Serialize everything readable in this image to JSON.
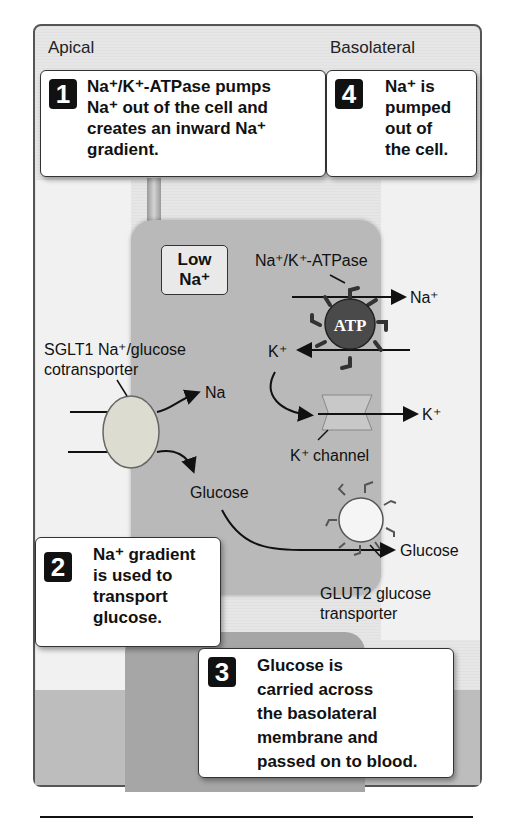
{
  "regions": {
    "apical": "Apical",
    "basolateral": "Basolateral"
  },
  "steps": [
    {
      "num": "1",
      "lines": [
        "Na⁺/K⁺-ATPase pumps",
        "Na⁺ out of the cell and",
        "creates an inward Na⁺",
        "gradient."
      ]
    },
    {
      "num": "2",
      "lines": [
        "Na⁺ gradient",
        "is used to",
        "transport",
        "glucose."
      ]
    },
    {
      "num": "3",
      "lines": [
        "Glucose is",
        "carried across",
        "the basolateral",
        "membrane and",
        "passed on to blood."
      ]
    },
    {
      "num": "4",
      "lines": [
        "Na⁺ is",
        "pumped",
        "out of",
        "the cell."
      ]
    }
  ],
  "cell": {
    "low_na_line1": "Low",
    "low_na_line2": "Na⁺"
  },
  "labels": {
    "atpase": "Na⁺/K⁺-ATPase",
    "atp": "ATP",
    "na_out": "Na⁺",
    "k_in": "K⁺",
    "sglt1_line1": "SGLT1 Na⁺/glucose",
    "sglt1_line2": "cotransporter",
    "na_in": "Na",
    "k_out": "K⁺",
    "k_channel": "K⁺ channel",
    "glucose_in": "Glucose",
    "glucose_out": "Glucose",
    "glut2_line1": "GLUT2 glucose",
    "glut2_line2": "transporter"
  }
}
